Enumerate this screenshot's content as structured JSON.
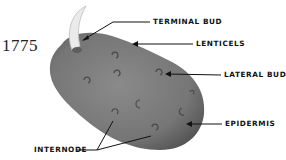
{
  "figure": {
    "number": "1775",
    "colors": {
      "tuber": "#7a7a7a",
      "tuber_shadow": "#5a5a5a",
      "sprout": "#e8e8e8",
      "line": "#111111"
    }
  },
  "labels": [
    {
      "id": "terminal-bud",
      "text": "TERMINAL BUD"
    },
    {
      "id": "lenticels",
      "text": "LENTICELS"
    },
    {
      "id": "lateral-bud",
      "text": "LATERAL BUD"
    },
    {
      "id": "epidermis",
      "text": "EPIDERMIS"
    },
    {
      "id": "internode",
      "text": "INTERNODE"
    }
  ]
}
